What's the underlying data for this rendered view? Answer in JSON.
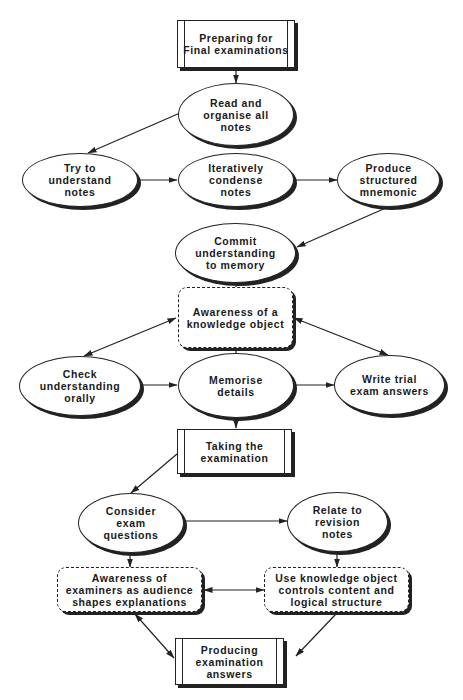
{
  "diagram": {
    "nodes": {
      "preparing": {
        "label": "Preparing for\nFinal examinations",
        "shape": "process"
      },
      "read_organise": {
        "label": "Read and\norganise all\nnotes",
        "shape": "ellipse"
      },
      "try_understand": {
        "label": "Try to\nunderstand\nnotes",
        "shape": "ellipse"
      },
      "iteratively_condense": {
        "label": "Iteratively\ncondense\nnotes",
        "shape": "ellipse"
      },
      "produce_mnemonic": {
        "label": "Produce\nstructured\nmnemonic",
        "shape": "ellipse"
      },
      "commit_memory": {
        "label": "Commit\nunderstanding\nto memory",
        "shape": "ellipse"
      },
      "awareness_ko": {
        "label": "Awareness of a\nknowledge object",
        "shape": "rounded"
      },
      "check_orally": {
        "label": "Check\nunderstanding\norally",
        "shape": "ellipse"
      },
      "memorise_details": {
        "label": "Memorise\ndetails",
        "shape": "ellipse"
      },
      "write_trial": {
        "label": "Write trial\nexam answers",
        "shape": "ellipse"
      },
      "taking_exam": {
        "label": "Taking the\nexamination",
        "shape": "process"
      },
      "consider_questions": {
        "label": "Consider\nexam\nquestions",
        "shape": "ellipse"
      },
      "relate_revision": {
        "label": "Relate to\nrevision\nnotes",
        "shape": "ellipse"
      },
      "awareness_examiners": {
        "label": "Awareness of\nexaminers as audience\nshapes explanations",
        "shape": "rounded"
      },
      "use_ko": {
        "label": "Use knowledge object\ncontrols content and\nlogical structure",
        "shape": "rounded"
      },
      "producing_answers": {
        "label": "Producing\nexamination\nanswers",
        "shape": "process"
      }
    },
    "edges": [
      {
        "from": "preparing",
        "to": "read_organise",
        "type": "directed"
      },
      {
        "from": "read_organise",
        "to": "try_understand",
        "type": "directed"
      },
      {
        "from": "try_understand",
        "to": "iteratively_condense",
        "type": "directed"
      },
      {
        "from": "iteratively_condense",
        "to": "produce_mnemonic",
        "type": "directed"
      },
      {
        "from": "produce_mnemonic",
        "to": "commit_memory",
        "type": "directed"
      },
      {
        "from": "commit_memory",
        "to": "awareness_ko",
        "type": "line"
      },
      {
        "from": "awareness_ko",
        "to": "check_orally",
        "type": "bidirectional"
      },
      {
        "from": "awareness_ko",
        "to": "write_trial",
        "type": "bidirectional"
      },
      {
        "from": "awareness_ko",
        "to": "memorise_details",
        "type": "line"
      },
      {
        "from": "check_orally",
        "to": "memorise_details",
        "type": "directed"
      },
      {
        "from": "memorise_details",
        "to": "write_trial",
        "type": "directed"
      },
      {
        "from": "memorise_details",
        "to": "taking_exam",
        "type": "directed"
      },
      {
        "from": "taking_exam",
        "to": "consider_questions",
        "type": "directed"
      },
      {
        "from": "consider_questions",
        "to": "relate_revision",
        "type": "directed"
      },
      {
        "from": "consider_questions",
        "to": "awareness_examiners",
        "type": "directed"
      },
      {
        "from": "relate_revision",
        "to": "use_ko",
        "type": "directed"
      },
      {
        "from": "awareness_examiners",
        "to": "use_ko",
        "type": "bidirectional"
      },
      {
        "from": "awareness_examiners",
        "to": "producing_answers",
        "type": "bidirectional"
      },
      {
        "from": "use_ko",
        "to": "producing_answers",
        "type": "directed"
      }
    ],
    "colors": {
      "ink": "#222222",
      "background": "#ffffff"
    }
  }
}
